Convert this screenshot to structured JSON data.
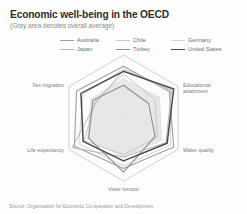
{
  "chart": {
    "title": "Economic well-being in the OECD",
    "subtitle": "(Gray area denotes overall average)",
    "source": "Source: Organisation for Economic Co-operation and Development"
  },
  "legend": {
    "items": [
      {
        "label": "Australia",
        "color": "#9e9e9e",
        "width": 1.1
      },
      {
        "label": "Chile",
        "color": "#c9c9c9",
        "width": 1.0
      },
      {
        "label": "Germany",
        "color": "#d4d4d4",
        "width": 1.0
      },
      {
        "label": "Japan",
        "color": "#b5b5b5",
        "width": 1.0
      },
      {
        "label": "Turkey",
        "color": "#8f8f8f",
        "width": 1.1
      },
      {
        "label": "United States",
        "color": "#4a4a4a",
        "width": 1.5
      }
    ]
  },
  "axis_labels": [
    "Employment rate",
    "Educational attainment",
    "Water quality",
    "Voter turnout",
    "Life expectancy",
    "Net migration"
  ],
  "chart_data": {
    "type": "radar",
    "title": "Economic well-being in the OECD",
    "subtitle": "(Gray area denotes overall average)",
    "categories": [
      "Employment rate",
      "Educational attainment",
      "Water quality",
      "Voter turnout",
      "Life expectancy",
      "Net migration"
    ],
    "rlim": [
      0,
      100
    ],
    "grid": false,
    "legend_position": "top",
    "average_label": "Overall average",
    "average_fill": "#e3e3e3",
    "average_values": [
      62,
      66,
      70,
      62,
      66,
      60
    ],
    "series": [
      {
        "name": "Australia",
        "color": "#9e9e9e",
        "values": [
          82,
          84,
          92,
          80,
          90,
          86
        ]
      },
      {
        "name": "Chile",
        "color": "#c9c9c9",
        "values": [
          70,
          58,
          62,
          58,
          72,
          52
        ]
      },
      {
        "name": "Germany",
        "color": "#d4d4d4",
        "values": [
          78,
          86,
          86,
          76,
          82,
          74
        ]
      },
      {
        "name": "Japan",
        "color": "#b5b5b5",
        "values": [
          76,
          88,
          78,
          62,
          94,
          50
        ]
      },
      {
        "name": "Turkey",
        "color": "#8f8f8f",
        "values": [
          52,
          46,
          58,
          86,
          64,
          56
        ]
      },
      {
        "name": "United States",
        "color": "#4a4a4a",
        "values": [
          74,
          92,
          80,
          68,
          74,
          78
        ]
      }
    ]
  }
}
